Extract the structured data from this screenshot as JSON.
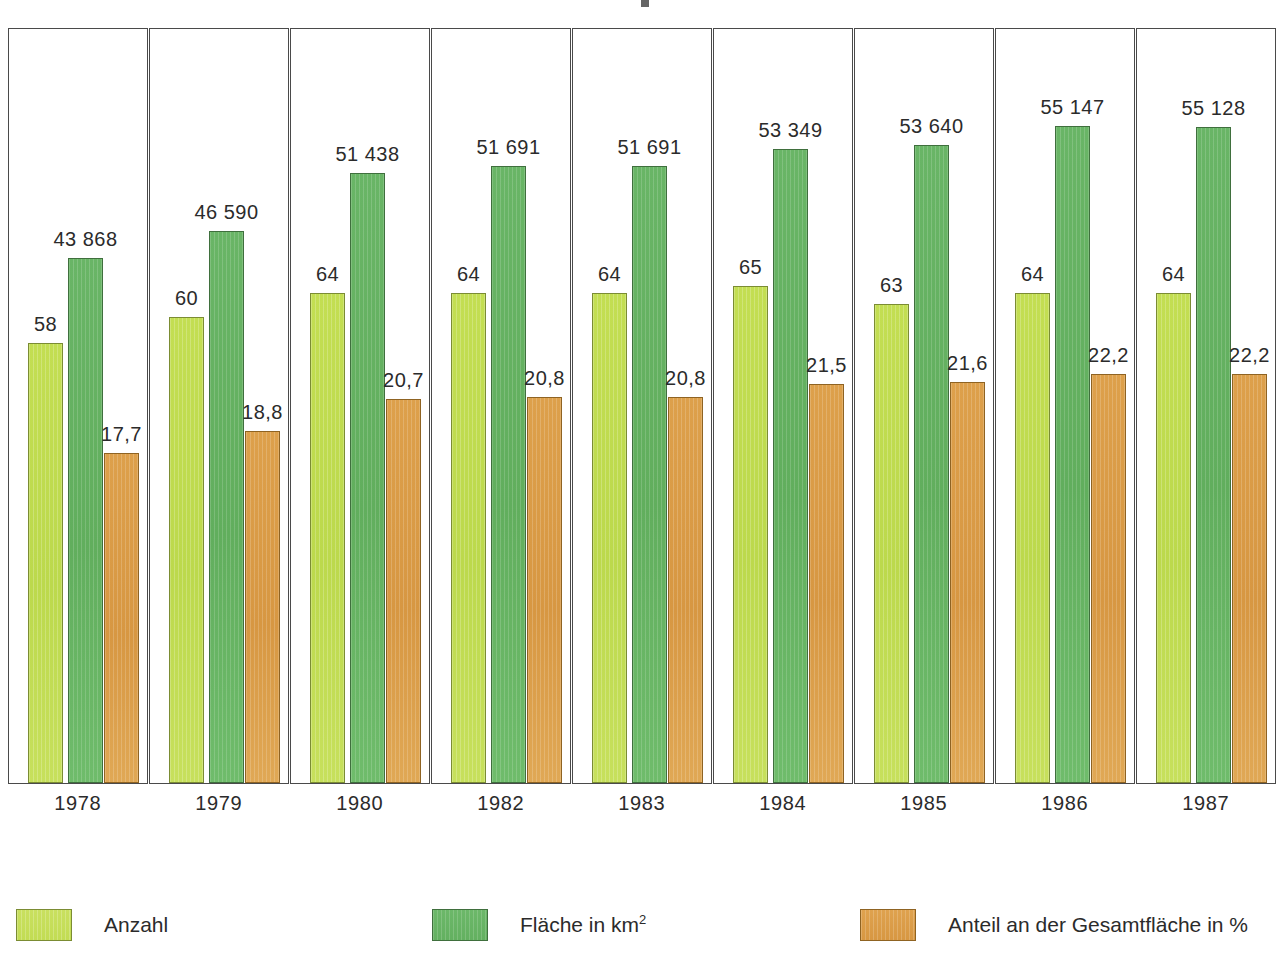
{
  "chart_data": {
    "type": "bar",
    "title": "",
    "xlabel": "",
    "ylabel": "",
    "grid": false,
    "legend_position": "bottom",
    "categories": [
      "1978",
      "1979",
      "1980",
      "1982",
      "1983",
      "1984",
      "1985",
      "1986",
      "1987"
    ],
    "series": [
      {
        "name": "Anzahl",
        "color": "#c2dc53",
        "values": [
          58,
          60,
          64,
          64,
          64,
          65,
          63,
          64,
          64
        ],
        "labels": [
          "58",
          "60",
          "64",
          "64",
          "64",
          "65",
          "63",
          "64",
          "64"
        ]
      },
      {
        "name": "Fläche in km2",
        "color": "#63b060",
        "values": [
          43868,
          46590,
          51438,
          51691,
          51691,
          53349,
          53640,
          55147,
          55128
        ],
        "labels": [
          "43 868",
          "46 590",
          "51 438",
          "51 691",
          "51 691",
          "53 349",
          "53 640",
          "55 147",
          "55 128"
        ]
      },
      {
        "name": "Anteil an der Gesamtfläche in %",
        "color": "#d79742",
        "values": [
          17.7,
          18.8,
          20.7,
          20.8,
          20.8,
          21.5,
          21.6,
          22.2,
          22.2
        ],
        "labels": [
          "17,7",
          "18,8",
          "20,7",
          "20,8",
          "20,8",
          "21,5",
          "21,6",
          "22,2",
          "22,2"
        ]
      }
    ]
  },
  "legend": {
    "items": [
      {
        "label": "Anzahl",
        "sup": "",
        "swatch": "count"
      },
      {
        "label": "Fläche in km",
        "sup": "2",
        "swatch": "area"
      },
      {
        "label": "Anteil an der Gesamtfläche in %",
        "sup": "",
        "swatch": "share"
      }
    ]
  }
}
